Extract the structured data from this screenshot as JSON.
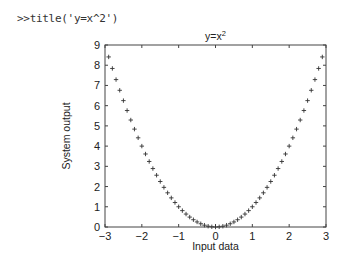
{
  "console": {
    "prompt": ">>",
    "command": "title('y=x^2')"
  },
  "chart_data": {
    "type": "scatter",
    "marker": "+",
    "title": "y=x^2",
    "title_display": {
      "base": "y=x",
      "superscript": "2"
    },
    "xlabel": "Input data",
    "ylabel": "System output",
    "xlim": [
      -3,
      3
    ],
    "ylim": [
      0,
      9
    ],
    "xticks": [
      -3,
      -2,
      -1,
      0,
      1,
      2,
      3
    ],
    "yticks": [
      0,
      1,
      2,
      3,
      4,
      5,
      6,
      7,
      8,
      9
    ],
    "grid": false,
    "legend": null,
    "x": [
      -2.9,
      -2.8,
      -2.7,
      -2.6,
      -2.5,
      -2.4,
      -2.3,
      -2.2,
      -2.1,
      -2.0,
      -1.9,
      -1.8,
      -1.7,
      -1.6,
      -1.5,
      -1.4,
      -1.3,
      -1.2,
      -1.1,
      -1.0,
      -0.9,
      -0.8,
      -0.7,
      -0.6,
      -0.5,
      -0.4,
      -0.3,
      -0.2,
      -0.1,
      0.0,
      0.1,
      0.2,
      0.3,
      0.4,
      0.5,
      0.6,
      0.7,
      0.8,
      0.9,
      1.0,
      1.1,
      1.2,
      1.3,
      1.4,
      1.5,
      1.6,
      1.7,
      1.8,
      1.9,
      2.0,
      2.1,
      2.2,
      2.3,
      2.4,
      2.5,
      2.6,
      2.7,
      2.8,
      2.9
    ],
    "y": [
      8.41,
      7.84,
      7.29,
      6.76,
      6.25,
      5.76,
      5.29,
      4.84,
      4.41,
      4.0,
      3.61,
      3.24,
      2.89,
      2.56,
      2.25,
      1.96,
      1.69,
      1.44,
      1.21,
      1.0,
      0.81,
      0.64,
      0.49,
      0.36,
      0.25,
      0.16,
      0.09,
      0.04,
      0.01,
      0.0,
      0.01,
      0.04,
      0.09,
      0.16,
      0.25,
      0.36,
      0.49,
      0.64,
      0.81,
      1.0,
      1.21,
      1.44,
      1.69,
      1.96,
      2.25,
      2.56,
      2.89,
      3.24,
      3.61,
      4.0,
      4.41,
      4.84,
      5.29,
      5.76,
      6.25,
      6.76,
      7.29,
      7.84,
      8.41
    ]
  },
  "colors": {
    "axes": "#444444",
    "marker": "#333333",
    "text": "#222222"
  }
}
